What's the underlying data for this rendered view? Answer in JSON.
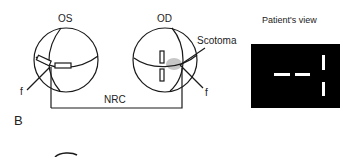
{
  "panel_label": "B",
  "left_eye": {
    "label": "OS",
    "fovea_label": "f"
  },
  "right_eye": {
    "label": "OD",
    "fovea_label": "f",
    "scotoma_label": "Scotoma"
  },
  "connector_label": "NRC",
  "patients_view": {
    "title": "Patient's view",
    "background": "#000000",
    "marks_color": "#ffffff"
  },
  "colors": {
    "line": "#1a1a1a",
    "scotoma": "#b8b8b8",
    "background": "#ffffff"
  }
}
